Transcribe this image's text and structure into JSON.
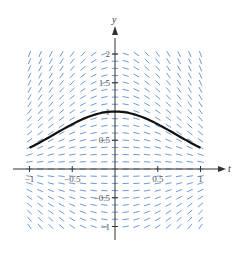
{
  "chart_data": {
    "type": "slope_field",
    "title": "",
    "equation": "dy/dt = -2ty",
    "solution_curve": {
      "description": "y = e^(-t^2)",
      "points": [
        [
          -1,
          0.37
        ],
        [
          -0.75,
          0.57
        ],
        [
          -0.5,
          0.78
        ],
        [
          -0.25,
          0.94
        ],
        [
          0,
          1.0
        ],
        [
          0.25,
          0.94
        ],
        [
          0.5,
          0.78
        ],
        [
          0.75,
          0.57
        ],
        [
          1,
          0.37
        ]
      ],
      "color": "#111111"
    },
    "xlabel": "t",
    "ylabel": "y",
    "xlim": [
      -1,
      1
    ],
    "ylim": [
      -1,
      2
    ],
    "x_ticks": [
      -1,
      -0.5,
      0.5,
      1
    ],
    "x_tick_labels": [
      "−1",
      "−0.5",
      "0.5",
      "1"
    ],
    "y_ticks": [
      -1,
      -0.5,
      0.5,
      1,
      1.5,
      2
    ],
    "y_tick_labels": [
      "−1",
      "−0.5",
      "0.5",
      "1",
      "1.5",
      "2"
    ],
    "grid": false,
    "field_step": 0.125,
    "field_color": "#5b8fd6"
  }
}
